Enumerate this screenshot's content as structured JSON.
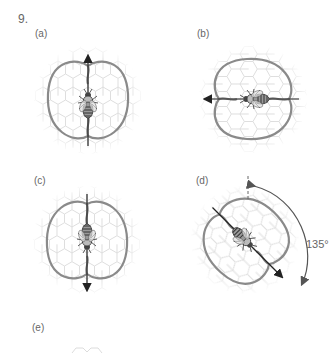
{
  "figure": {
    "number": "9.",
    "panels": [
      {
        "id": "a",
        "label": "(a)",
        "direction": "up",
        "angle_deg": 0
      },
      {
        "id": "b",
        "label": "(b)",
        "direction": "left",
        "angle_deg": -90
      },
      {
        "id": "c",
        "label": "(c)",
        "direction": "down",
        "angle_deg": 180
      },
      {
        "id": "d",
        "label": "(d)",
        "direction": "down-right",
        "angle_deg": 135,
        "angle_label": "135°"
      },
      {
        "id": "e",
        "label": "(e)"
      }
    ]
  },
  "colors": {
    "waggle_path": "#8a8a8a",
    "comb": "#e4e4e4",
    "bee": "#3a3a3a",
    "arrow": "#222222",
    "text": "#666666"
  }
}
